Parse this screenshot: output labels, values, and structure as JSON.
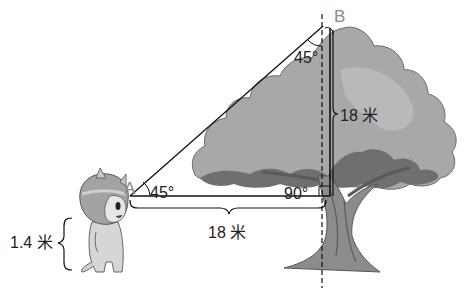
{
  "diagram": {
    "points": {
      "A": "A",
      "B": "B"
    },
    "angles": {
      "at_A": "45°",
      "at_B": "45°",
      "right_angle": "90°"
    },
    "measurements": {
      "horizontal_distance": "18 米",
      "vertical_height": "18 米",
      "eye_height": "1.4 米"
    },
    "colors": {
      "canopy_light": "#a9a9a9",
      "canopy_dark": "#6f6f6f",
      "trunk": "#8c8c8c",
      "trunk_dark": "#5a5a5a",
      "line": "#111111",
      "label": "#222222",
      "point_label": "#8a8a8a"
    }
  }
}
